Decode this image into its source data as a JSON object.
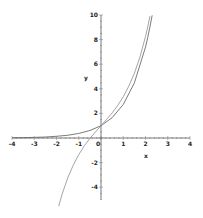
{
  "chart_data": {
    "type": "line",
    "title": "",
    "xlabel": "x",
    "ylabel": "y",
    "xlim": [
      -4,
      4
    ],
    "ylim": [
      -5,
      10
    ],
    "grid": false,
    "legend": "none",
    "x_ticks": [
      -4,
      -3,
      -2,
      -1,
      0,
      1,
      2,
      3,
      4
    ],
    "x_tick_labels": [
      "-4",
      "-3",
      "-2",
      "-1",
      "0",
      "1",
      "2",
      "3",
      "4"
    ],
    "y_ticks": [
      10,
      8,
      6,
      4,
      2,
      -2,
      -4
    ],
    "y_tick_labels": [
      "10",
      "8",
      "6",
      "4",
      "2",
      "-2",
      "-4"
    ],
    "series": [
      {
        "name": "curve-1",
        "color": "#6b6b6b",
        "x": [
          -4,
          -3.5,
          -3,
          -2.5,
          -2,
          -1.5,
          -1,
          -0.5,
          0,
          0.5,
          1,
          1.5,
          2,
          2.1,
          2.2,
          2.3
        ],
        "y": [
          0.02,
          0.03,
          0.05,
          0.08,
          0.14,
          0.22,
          0.37,
          0.61,
          1.0,
          1.65,
          2.72,
          4.48,
          7.39,
          8.17,
          9.03,
          9.97
        ]
      },
      {
        "name": "curve-2",
        "color": "#9a9a9a",
        "x": [
          -1.9,
          -1.75,
          -1.5,
          -1.25,
          -1,
          -0.75,
          -0.5,
          -0.25,
          0,
          0.25,
          0.5,
          0.75,
          1,
          1.25,
          1.5,
          1.75,
          2,
          2.1,
          2.2
        ],
        "y": [
          -5.54,
          -4.58,
          -3.26,
          -2.22,
          -1.35,
          -0.64,
          -0.04,
          0.49,
          1.0,
          1.51,
          2.04,
          2.64,
          3.35,
          4.22,
          5.26,
          6.58,
          8.25,
          9.03,
          9.91
        ]
      }
    ]
  }
}
